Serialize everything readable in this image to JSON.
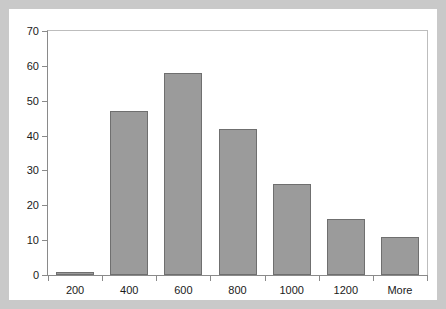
{
  "chart_data": {
    "type": "bar",
    "title": "",
    "subtitle": "",
    "xlabel": "",
    "ylabel": "",
    "categories": [
      "200",
      "400",
      "600",
      "800",
      "1000",
      "1200",
      "More"
    ],
    "values": [
      1,
      47,
      58,
      42,
      26,
      16,
      11
    ],
    "ylim": [
      0,
      70
    ],
    "ytick_step": 10,
    "yticks": [
      "0",
      "10",
      "20",
      "30",
      "40",
      "50",
      "60",
      "70"
    ],
    "grid": false,
    "legend": null,
    "legend_position": "none",
    "annotations": [],
    "series": [
      {
        "name": "Frequency",
        "values": [
          1,
          47,
          58,
          42,
          26,
          16,
          11
        ]
      }
    ]
  },
  "style": {
    "frame_color": "#c9c9c9",
    "canvas_color": "#ffffff",
    "bar_fill": "#9b9b9b",
    "bar_border": "#6f6f6f",
    "axis_color": "#8a8a8a",
    "plot_border_color": "#bdbdbd",
    "text_color": "#1a1a1a"
  }
}
